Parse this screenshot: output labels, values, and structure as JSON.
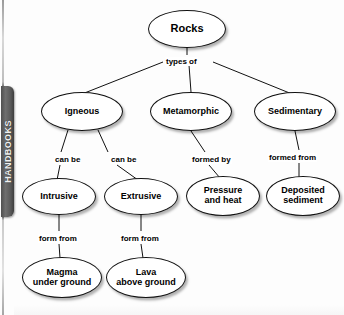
{
  "margin_tab": {
    "label": "HANDBOOKS"
  },
  "diagram": {
    "type": "tree",
    "nodes": [
      {
        "id": "rocks",
        "label": "Rocks",
        "x": 148,
        "y": 10,
        "w": 78,
        "h": 38,
        "font_size": 11
      },
      {
        "id": "igneous",
        "label": "Igneous",
        "x": 41,
        "y": 92,
        "w": 82,
        "h": 39,
        "font_size": 9
      },
      {
        "id": "metamorphic",
        "label": "Metamorphic",
        "x": 150,
        "y": 92,
        "w": 82,
        "h": 39,
        "font_size": 9
      },
      {
        "id": "sedimentary",
        "label": "Sedimentary",
        "x": 254,
        "y": 92,
        "w": 82,
        "h": 39,
        "font_size": 9
      },
      {
        "id": "intrusive",
        "label": "Intrusive",
        "x": 22,
        "y": 178,
        "w": 74,
        "h": 37,
        "font_size": 9
      },
      {
        "id": "extrusive",
        "label": "Extrusive",
        "x": 104,
        "y": 178,
        "w": 74,
        "h": 37,
        "font_size": 9
      },
      {
        "id": "pressure-and-heat",
        "label": "Pressure\nand heat",
        "x": 186,
        "y": 176,
        "w": 74,
        "h": 40,
        "font_size": 9
      },
      {
        "id": "deposited-sediment",
        "label": "Deposited\nsediment",
        "x": 266,
        "y": 176,
        "w": 74,
        "h": 40,
        "font_size": 9
      },
      {
        "id": "magma-under-ground",
        "label": "Magma\nunder ground",
        "x": 22,
        "y": 257,
        "w": 80,
        "h": 41,
        "font_size": 9
      },
      {
        "id": "lava-above-ground",
        "label": "Lava\nabove ground",
        "x": 106,
        "y": 257,
        "w": 80,
        "h": 41,
        "font_size": 9
      }
    ],
    "edge_labels": [
      {
        "id": "types-of",
        "text": "types of",
        "x": 165,
        "y": 57
      },
      {
        "id": "can-be-left",
        "text": "can be",
        "x": 54,
        "y": 155
      },
      {
        "id": "can-be-right",
        "text": "can be",
        "x": 110,
        "y": 155
      },
      {
        "id": "formed-by",
        "text": "formed by",
        "x": 191,
        "y": 155
      },
      {
        "id": "formed-from",
        "text": "formed from",
        "x": 268,
        "y": 153
      },
      {
        "id": "form-from-magma",
        "text": "form from",
        "x": 38,
        "y": 234
      },
      {
        "id": "form-from-lava",
        "text": "form from",
        "x": 120,
        "y": 234
      }
    ],
    "edges": [
      {
        "from": "rocks",
        "to": "types-of",
        "path": "M187,48 L187,55"
      },
      {
        "from": "types-of",
        "to": "igneous",
        "path": "M163,62 L82,94"
      },
      {
        "from": "types-of",
        "to": "metamorphic",
        "path": "M189,65 L191,92"
      },
      {
        "from": "types-of",
        "to": "sedimentary",
        "path": "M213,62 L292,94"
      },
      {
        "from": "igneous",
        "to": "can-be-left",
        "path": "M68,130 L61,152"
      },
      {
        "from": "igneous",
        "to": "can-be-right",
        "path": "M98,130 L108,152"
      },
      {
        "from": "can-be-left",
        "to": "intrusive",
        "path": "M60,165 L57,180"
      },
      {
        "from": "can-be-right",
        "to": "extrusive",
        "path": "M117,165 L138,180"
      },
      {
        "from": "metamorphic",
        "to": "formed-by",
        "path": "M191,131 L205,152"
      },
      {
        "from": "formed-by",
        "to": "pressure-and-heat",
        "path": "M209,165 L220,178"
      },
      {
        "from": "sedimentary",
        "to": "formed-from",
        "path": "M295,131 L299,150"
      },
      {
        "from": "formed-from",
        "to": "deposited-sediment",
        "path": "M299,163 L299,178"
      },
      {
        "from": "intrusive",
        "to": "form-from-magma",
        "path": "M59,215 L59,231"
      },
      {
        "from": "form-from-magma",
        "to": "magma-under-ground",
        "path": "M59,244 L60,258"
      },
      {
        "from": "extrusive",
        "to": "form-from-lava",
        "path": "M141,215 L141,231"
      },
      {
        "from": "form-from-lava",
        "to": "lava-above-ground",
        "path": "M141,244 L143,258"
      }
    ]
  }
}
